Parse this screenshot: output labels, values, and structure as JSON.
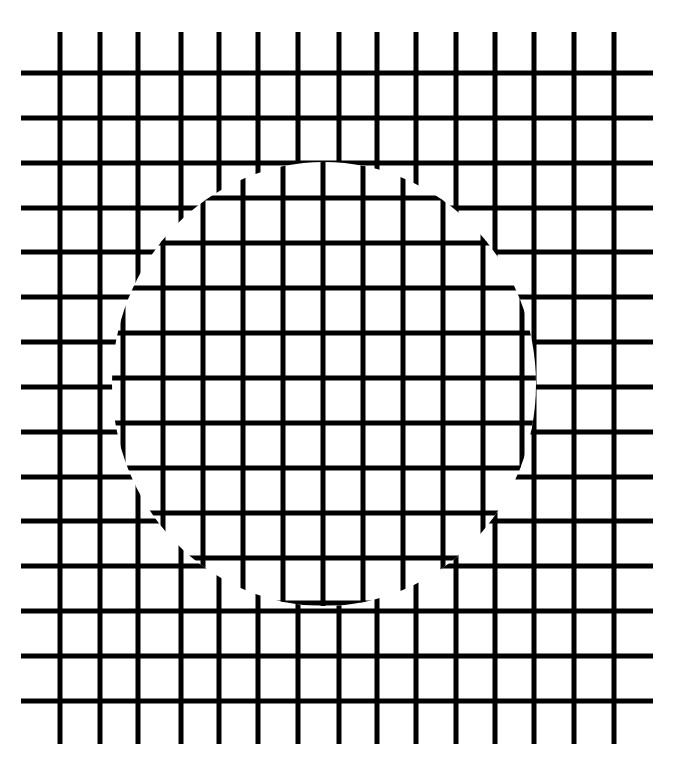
{
  "figure": {
    "title": "Grid illusion with offset circular patch",
    "background": "#ffffff",
    "line_color": "#000000",
    "line_width": 5
  },
  "outer_grid": {
    "vertical_x": [
      60,
      100,
      138,
      181,
      219,
      258,
      298,
      339,
      377,
      416,
      456,
      495,
      534,
      574,
      614
    ],
    "vertical_y_range": [
      32,
      744
    ],
    "horizontal_y": [
      73,
      118,
      163,
      208,
      252,
      297,
      342,
      387,
      432,
      477,
      521,
      566,
      611,
      656,
      701
    ],
    "horizontal_x_range": [
      21,
      653
    ]
  },
  "inner_patch": {
    "shape": "circle",
    "cx": 324,
    "cy": 384,
    "rx": 212,
    "ry": 222,
    "vertical_x": [
      83,
      123,
      163,
      203,
      243,
      283,
      323,
      363,
      403,
      443,
      483,
      522,
      562
    ],
    "horizontal_y": [
      153,
      198,
      243,
      288,
      333,
      378,
      423,
      468,
      513,
      558,
      603
    ]
  }
}
